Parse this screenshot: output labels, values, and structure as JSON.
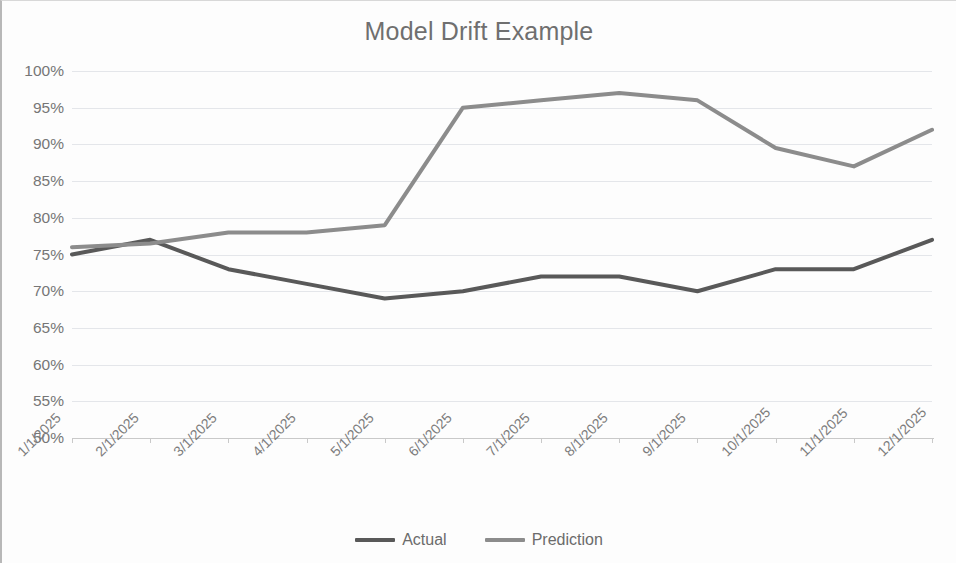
{
  "chart_data": {
    "type": "line",
    "title": "Model Drift Example",
    "xlabel": "",
    "ylabel": "",
    "categories": [
      "1/1/2025",
      "2/1/2025",
      "3/1/2025",
      "4/1/2025",
      "5/1/2025",
      "6/1/2025",
      "7/1/2025",
      "8/1/2025",
      "9/1/2025",
      "10/1/2025",
      "11/1/2025",
      "12/1/2025"
    ],
    "series": [
      {
        "name": "Actual",
        "color": "#595959",
        "values": [
          75,
          77,
          73,
          71,
          69,
          70,
          72,
          72,
          70,
          73,
          73,
          77
        ]
      },
      {
        "name": "Prediction",
        "color": "#8c8c8c",
        "values": [
          76,
          76.5,
          78,
          78,
          79,
          95,
          96,
          97,
          96,
          89.5,
          87,
          92
        ]
      }
    ],
    "ylim": [
      50,
      100
    ],
    "ytick_step": 5,
    "ytick_labels": [
      "100%",
      "95%",
      "90%",
      "85%",
      "80%",
      "75%",
      "70%",
      "65%",
      "60%",
      "55%",
      "50%"
    ],
    "ytick_values": [
      100,
      95,
      90,
      85,
      80,
      75,
      70,
      65,
      60,
      55,
      50
    ],
    "value_suffix": "%",
    "grid": true,
    "grid_axis": "y",
    "legend_position": "bottom",
    "legend_entries": [
      "Actual",
      "Prediction"
    ]
  },
  "colors": {
    "grid": "#e4e6ea",
    "axis": "#c9c9c9",
    "title_text": "#6f6f6f",
    "tick_text": "#767676",
    "background": "#fdfdfd"
  }
}
